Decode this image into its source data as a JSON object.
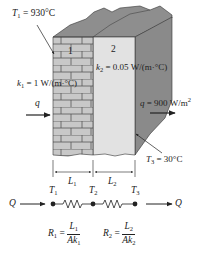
{
  "figure": {
    "layers": [
      {
        "id": "1",
        "label": "1",
        "k_symbol": "k",
        "k_sub": "1",
        "k_value": "= 1 W/(m·°C)",
        "material": "brick"
      },
      {
        "id": "2",
        "label": "2",
        "k_symbol": "k",
        "k_sub": "2",
        "k_value": "= 0.05 W/(m·°C)",
        "material": "insulation"
      }
    ],
    "t1": {
      "symbol": "T",
      "sub": "1",
      "value": "= 930°C"
    },
    "t3": {
      "symbol": "T",
      "sub": "3",
      "value": "= 30°C"
    },
    "q_in": {
      "symbol": "q"
    },
    "q_out": {
      "symbol": "q",
      "value": "= 900 W/m",
      "exp": "2"
    },
    "dimensions": [
      {
        "symbol": "L",
        "sub": "1"
      },
      {
        "symbol": "L",
        "sub": "2"
      }
    ],
    "circuit": {
      "q_left": "Q",
      "q_right": "Q",
      "nodes": [
        {
          "symbol": "T",
          "sub": "1"
        },
        {
          "symbol": "T",
          "sub": "2"
        },
        {
          "symbol": "T",
          "sub": "3"
        }
      ]
    },
    "equations": [
      {
        "lhs": "R",
        "lhs_sub": "1",
        "eq": "=",
        "num": "L",
        "num_sub": "1",
        "den": "Ak",
        "den_sub": "1"
      },
      {
        "lhs": "R",
        "lhs_sub": "2",
        "eq": "=",
        "num": "L",
        "num_sub": "2",
        "den": "Ak",
        "den_sub": "2"
      }
    ],
    "colors": {
      "brick_fill": "#c8c8c8",
      "mortar": "#555555",
      "insulation_fill": "#e2e2e2",
      "side_fill": "#8a8a8a",
      "top_fill": "#8e8e8e",
      "ink": "#222222"
    }
  }
}
